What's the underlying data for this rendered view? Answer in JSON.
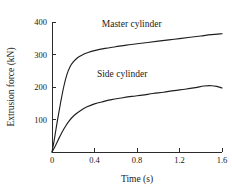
{
  "chart_data": {
    "type": "line",
    "title": "",
    "xlabel": "Time (s)",
    "ylabel": "Extrusion force (kN)",
    "xlim": [
      0,
      1.6
    ],
    "ylim": [
      0,
      400
    ],
    "xticks": [
      "0",
      "0.4",
      "0.8",
      "1.2",
      "1.6"
    ],
    "xtick_values": [
      0,
      0.4,
      0.8,
      1.2,
      1.6
    ],
    "yticks": [
      "0",
      "100",
      "200",
      "300",
      "400"
    ],
    "ytick_values": [
      0,
      100,
      200,
      300,
      400
    ],
    "grid": false,
    "legend": "inline-labels",
    "series": [
      {
        "name": "Master cylinder",
        "label_position": "above-curve-right",
        "x": [
          0.0,
          0.02,
          0.05,
          0.08,
          0.11,
          0.14,
          0.17,
          0.2,
          0.24,
          0.28,
          0.34,
          0.4,
          0.5,
          0.6,
          0.7,
          0.8,
          0.9,
          1.0,
          1.1,
          1.2,
          1.3,
          1.4,
          1.5,
          1.6
        ],
        "values": [
          0,
          35,
          95,
          150,
          200,
          238,
          262,
          277,
          290,
          298,
          306,
          312,
          319,
          324,
          329,
          333,
          337,
          341,
          345,
          349,
          353,
          357,
          361,
          364
        ]
      },
      {
        "name": "Side cylinder",
        "label_position": "above-curve-center",
        "x": [
          0.0,
          0.03,
          0.07,
          0.11,
          0.16,
          0.21,
          0.27,
          0.33,
          0.4,
          0.48,
          0.56,
          0.65,
          0.75,
          0.85,
          0.95,
          1.05,
          1.15,
          1.25,
          1.35,
          1.43,
          1.5,
          1.55,
          1.6
        ],
        "values": [
          0,
          18,
          45,
          70,
          95,
          113,
          128,
          139,
          148,
          155,
          161,
          166,
          171,
          175,
          180,
          184,
          189,
          193,
          198,
          203,
          204,
          202,
          197
        ]
      }
    ],
    "annotations": [
      {
        "text": "Master cylinder",
        "x": 0.75,
        "y": 385
      },
      {
        "text": "Side cylinder",
        "x": 0.66,
        "y": 232
      }
    ]
  }
}
